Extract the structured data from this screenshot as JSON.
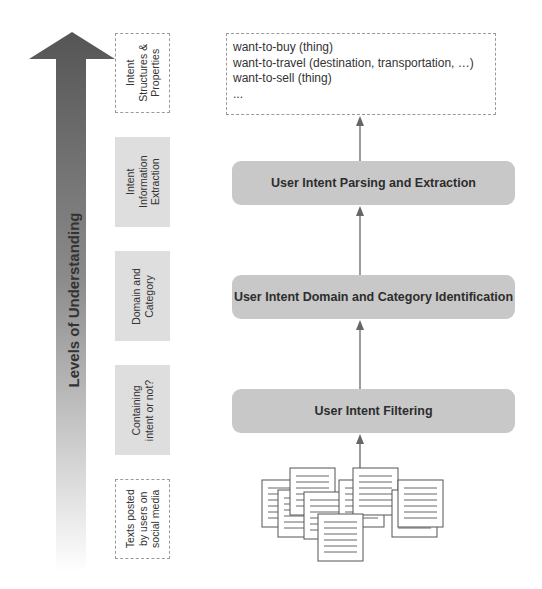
{
  "axis": {
    "label": "Levels of Understanding",
    "gradient_top": "#555555",
    "gradient_bottom": "#ffffff"
  },
  "levels": [
    {
      "label": "Intent\nStructures &\nProperties",
      "style": "outlined"
    },
    {
      "label": "Intent\nInformation\nExtraction",
      "style": "shaded"
    },
    {
      "label": "Domain and\nCategory",
      "style": "shaded"
    },
    {
      "label": "Containing\nintent or not?",
      "style": "shaded"
    },
    {
      "label": "Texts posted\nby users on\nsocial media",
      "style": "outlined"
    }
  ],
  "output": {
    "lines": [
      "want-to-buy (thing)",
      "want-to-travel (destination, transportation, …)",
      "want-to-sell (thing)",
      "..."
    ]
  },
  "stages": [
    {
      "label": "User Intent Parsing and Extraction"
    },
    {
      "label": "User Intent Domain and Category Identification"
    },
    {
      "label": "User Intent Filtering"
    }
  ],
  "input": {
    "icon": "document-stack-icon",
    "document_count": 9
  },
  "colors": {
    "stage_fill": "#c8c8c8",
    "level_fill": "#dedede",
    "connector": "#666666"
  }
}
